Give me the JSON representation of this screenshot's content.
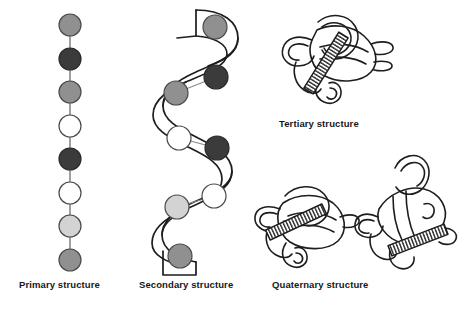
{
  "figure": {
    "background_color": "#ffffff",
    "line_color": "#1d1d1d"
  },
  "captions": {
    "primary": "Primary structure",
    "secondary": "Secondary structure",
    "tertiary": "Tertiary structure",
    "quaternary": "Quaternary structure"
  },
  "palette": {
    "medium_gray": "#909090",
    "dark_gray": "#3b3b3b",
    "white": "#ffffff",
    "light_gray": "#d3d3d3",
    "outline": "#4a4a4a",
    "stroke": "#1d1d1d",
    "text": "#171717"
  },
  "primary_structure": {
    "label": "Primary structure",
    "description": "Linear chain of eight amino acid residues connected by bonds",
    "residue_count": 8,
    "residues": [
      {
        "index": 1,
        "shade": "medium_gray",
        "color": "#909090",
        "cx": 70,
        "cy": 25,
        "r": 11
      },
      {
        "index": 2,
        "shade": "dark_gray",
        "color": "#3b3b3b",
        "cx": 70,
        "cy": 59,
        "r": 11
      },
      {
        "index": 3,
        "shade": "medium_gray",
        "color": "#909090",
        "cx": 70,
        "cy": 92,
        "r": 11
      },
      {
        "index": 4,
        "shade": "white",
        "color": "#ffffff",
        "cx": 70,
        "cy": 126,
        "r": 11
      },
      {
        "index": 5,
        "shade": "dark_gray",
        "color": "#3b3b3b",
        "cx": 70,
        "cy": 159,
        "r": 11
      },
      {
        "index": 6,
        "shade": "white",
        "color": "#ffffff",
        "cx": 70,
        "cy": 193,
        "r": 11
      },
      {
        "index": 7,
        "shade": "light_gray",
        "color": "#d3d3d3",
        "cx": 70,
        "cy": 226,
        "r": 11
      },
      {
        "index": 8,
        "shade": "medium_gray",
        "color": "#909090",
        "cx": 70,
        "cy": 260,
        "r": 11
      }
    ]
  },
  "secondary_structure": {
    "label": "Secondary structure",
    "description": "Coiled alpha-helix ribbon carrying the same eight residues",
    "residue_count": 8,
    "residues": [
      {
        "index": 1,
        "shade": "medium_gray",
        "color": "#909090",
        "cx": 215,
        "cy": 27,
        "r": 12
      },
      {
        "index": 2,
        "shade": "dark_gray",
        "color": "#3b3b3b",
        "cx": 216,
        "cy": 77,
        "r": 12
      },
      {
        "index": 3,
        "shade": "medium_gray",
        "color": "#909090",
        "cx": 176,
        "cy": 93,
        "r": 12
      },
      {
        "index": 4,
        "shade": "white",
        "color": "#ffffff",
        "cx": 179,
        "cy": 138,
        "r": 12
      },
      {
        "index": 5,
        "shade": "dark_gray",
        "color": "#3b3b3b",
        "cx": 217,
        "cy": 148,
        "r": 12
      },
      {
        "index": 6,
        "shade": "white",
        "color": "#ffffff",
        "cx": 214,
        "cy": 196,
        "r": 12
      },
      {
        "index": 7,
        "shade": "light_gray",
        "color": "#d3d3d3",
        "cx": 177,
        "cy": 207,
        "r": 12
      },
      {
        "index": 8,
        "shade": "medium_gray",
        "color": "#909090",
        "cx": 180,
        "cy": 256,
        "r": 12
      }
    ]
  },
  "tertiary_structure": {
    "label": "Tertiary structure",
    "description": "Single folded polypeptide subunit with one coiled helix segment",
    "subunit_count": 1,
    "helix_segments": 1
  },
  "quaternary_structure": {
    "label": "Quaternary structure",
    "description": "Two folded subunits associated together, each with a coiled helix segment",
    "subunit_count": 2,
    "helix_segments": 2
  }
}
